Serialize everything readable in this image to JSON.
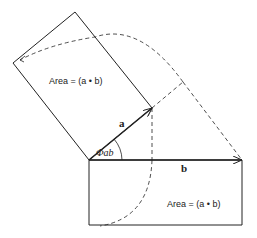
{
  "diagram": {
    "area_label_top": "Area = (a • b)",
    "area_label_bottom": "Area = (a • b)",
    "vector_a": "a",
    "vector_b": "b",
    "angle_label": "Φab",
    "colors": {
      "line": "#222222",
      "background": "#ffffff"
    }
  }
}
